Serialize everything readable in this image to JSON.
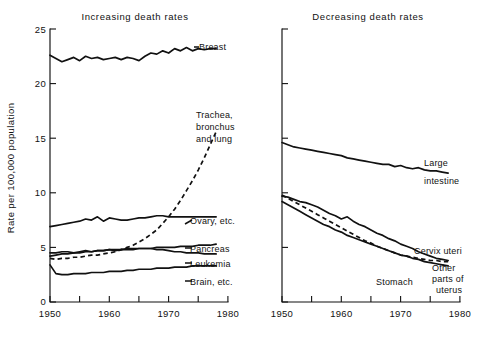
{
  "figure": {
    "ylabel": "Rate per 100,000 population",
    "panels": [
      {
        "key": "increasing",
        "title": "Increasing death rates"
      },
      {
        "key": "decreasing",
        "title": "Decreasing death rates"
      }
    ]
  },
  "axes": {
    "y_ticks": [
      0,
      5,
      10,
      15,
      20,
      25
    ],
    "y_tick_labels": [
      "0",
      "5",
      "10",
      "15",
      "20",
      "25"
    ],
    "x_tick_labels": [
      "1950",
      "1960",
      "1970",
      "1980"
    ],
    "x_minor_step": 5
  },
  "chart_data": {
    "type": "line",
    "xlabel": "",
    "ylabel": "Rate per 100,000 population",
    "xlim": [
      1950,
      1980
    ],
    "ylim": [
      0,
      25
    ],
    "grid": false,
    "legend": "inline-labels-right",
    "panels": [
      {
        "name": "Increasing death rates",
        "x": [
          1950,
          1951,
          1952,
          1953,
          1954,
          1955,
          1956,
          1957,
          1958,
          1959,
          1960,
          1961,
          1962,
          1963,
          1964,
          1965,
          1966,
          1967,
          1968,
          1969,
          1970,
          1971,
          1972,
          1973,
          1974,
          1975,
          1976,
          1977,
          1978
        ],
        "series": [
          {
            "name": "Breast",
            "style": "solid",
            "label": "Breast",
            "values": [
              22.6,
              22.3,
              22.0,
              22.2,
              22.4,
              22.1,
              22.5,
              22.3,
              22.4,
              22.2,
              22.3,
              22.4,
              22.2,
              22.4,
              22.3,
              22.1,
              22.5,
              22.8,
              22.7,
              23.0,
              22.8,
              23.2,
              23.0,
              23.3,
              23.0,
              23.2,
              23.1,
              23.2,
              23.2
            ]
          },
          {
            "name": "Trachea, bronchus and lung",
            "style": "dashed",
            "label": "Trachea, bronchus and lung",
            "values": [
              4.0,
              3.9,
              4.0,
              4.0,
              4.1,
              4.1,
              4.2,
              4.3,
              4.3,
              4.4,
              4.5,
              4.6,
              4.8,
              5.0,
              5.2,
              5.5,
              5.8,
              6.2,
              6.6,
              7.2,
              7.8,
              8.5,
              9.3,
              10.2,
              11.1,
              12.1,
              13.2,
              14.4,
              15.6
            ]
          },
          {
            "name": "Ovary, etc.",
            "style": "solid",
            "label": "Ovary, etc.",
            "values": [
              6.9,
              7.0,
              7.1,
              7.2,
              7.3,
              7.4,
              7.6,
              7.5,
              7.8,
              7.4,
              7.7,
              7.6,
              7.5,
              7.5,
              7.6,
              7.7,
              7.7,
              7.8,
              7.9,
              7.9,
              7.8,
              7.8,
              7.8,
              7.8,
              7.8,
              7.8,
              7.8,
              7.8,
              7.8
            ]
          },
          {
            "name": "Pancreas",
            "style": "solid",
            "label": "Pancreas",
            "values": [
              4.5,
              4.5,
              4.6,
              4.6,
              4.5,
              4.6,
              4.7,
              4.6,
              4.7,
              4.7,
              4.8,
              4.7,
              4.8,
              4.8,
              4.8,
              4.9,
              4.9,
              4.9,
              5.0,
              5.0,
              5.0,
              5.0,
              5.1,
              5.1,
              5.1,
              5.2,
              5.2,
              5.2,
              5.3
            ]
          },
          {
            "name": "Leukemia",
            "style": "solid",
            "label": "Leukemia",
            "values": [
              4.2,
              4.3,
              4.4,
              4.4,
              4.5,
              4.5,
              4.6,
              4.6,
              4.7,
              4.7,
              4.8,
              4.8,
              4.8,
              4.9,
              4.9,
              4.9,
              4.9,
              4.9,
              4.8,
              4.8,
              4.7,
              4.6,
              4.6,
              4.5,
              4.5,
              4.5,
              4.4,
              4.4,
              4.4
            ]
          },
          {
            "name": "Brain, etc.",
            "style": "solid",
            "label": "Brain, etc.",
            "values": [
              3.4,
              2.6,
              2.5,
              2.5,
              2.6,
              2.6,
              2.6,
              2.7,
              2.7,
              2.7,
              2.8,
              2.8,
              2.8,
              2.9,
              2.9,
              3.0,
              3.0,
              3.0,
              3.1,
              3.1,
              3.1,
              3.2,
              3.2,
              3.2,
              3.3,
              3.3,
              3.3,
              3.3,
              3.3
            ]
          }
        ]
      },
      {
        "name": "Decreasing death rates",
        "x": [
          1950,
          1951,
          1952,
          1953,
          1954,
          1955,
          1956,
          1957,
          1958,
          1959,
          1960,
          1961,
          1962,
          1963,
          1964,
          1965,
          1966,
          1967,
          1968,
          1969,
          1970,
          1971,
          1972,
          1973,
          1974,
          1975,
          1976,
          1977,
          1978
        ],
        "series": [
          {
            "name": "Large intestine",
            "style": "solid",
            "label": "Large intestine",
            "values": [
              14.6,
              14.4,
              14.2,
              14.1,
              14.0,
              13.9,
              13.8,
              13.7,
              13.6,
              13.5,
              13.4,
              13.2,
              13.1,
              13.0,
              12.9,
              12.8,
              12.7,
              12.6,
              12.6,
              12.4,
              12.5,
              12.3,
              12.2,
              12.3,
              12.1,
              12.0,
              12.0,
              11.9,
              11.8
            ]
          },
          {
            "name": "Stomach",
            "style": "solid",
            "label": "Stomach",
            "values": [
              9.2,
              8.9,
              8.6,
              8.3,
              8.0,
              7.7,
              7.4,
              7.1,
              6.9,
              6.6,
              6.4,
              6.1,
              5.9,
              5.7,
              5.5,
              5.3,
              5.1,
              4.9,
              4.7,
              4.5,
              4.3,
              4.2,
              4.0,
              3.9,
              3.7,
              3.6,
              3.5,
              3.4,
              3.3
            ]
          },
          {
            "name": "Cervix uteri",
            "style": "solid",
            "label": "Cervix uteri",
            "values": [
              9.7,
              9.6,
              9.4,
              9.2,
              9.1,
              8.9,
              8.7,
              8.4,
              8.1,
              7.9,
              7.6,
              7.8,
              7.4,
              7.1,
              6.9,
              6.6,
              6.3,
              6.1,
              5.8,
              5.6,
              5.3,
              5.1,
              4.9,
              4.6,
              4.4,
              4.2,
              4.0,
              3.9,
              3.8
            ]
          },
          {
            "name": "Other parts of uterus",
            "style": "dashed",
            "label": "Other parts of uterus",
            "values": [
              9.8,
              9.5,
              9.2,
              8.9,
              8.6,
              8.3,
              8.0,
              7.7,
              7.4,
              7.1,
              6.8,
              6.5,
              6.2,
              5.9,
              5.6,
              5.4,
              5.1,
              4.9,
              4.7,
              4.5,
              4.3,
              4.2,
              4.1,
              4.0,
              3.9,
              3.8,
              3.8,
              3.7,
              3.7
            ]
          }
        ]
      }
    ]
  },
  "labels": {
    "breast": "Breast",
    "trachea_1": "Trachea,",
    "trachea_2": "bronchus",
    "trachea_3": "and lung",
    "ovary": "Ovary, etc.",
    "pancreas": "Pancreas",
    "leukemia": "Leukemia",
    "brain": "Brain, etc.",
    "large": "Large",
    "intestine": "intestine",
    "cervix": "Cervix uteri",
    "stomach": "Stomach",
    "other_1": "Other",
    "other_2": "parts of",
    "other_3": "uterus"
  }
}
